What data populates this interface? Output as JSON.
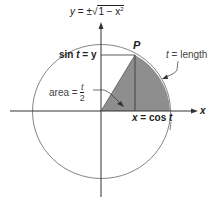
{
  "diagram": {
    "title_equation": {
      "lhs": "y",
      "eq": " = ±",
      "radical": "√",
      "under": "1 − x",
      "exp": "2"
    },
    "labels": {
      "point": "P",
      "sin_lhs": "sin ",
      "sin_t": "t",
      "sin_rhs": " = y",
      "length_t": "t",
      "length_rhs": " = length",
      "area_lhs": "area = ",
      "area_num": "t",
      "area_den": "2",
      "cos_lhs": "x",
      "cos_mid": " = cos ",
      "cos_t": "t",
      "x_axis": "x"
    },
    "colors": {
      "sector": "#8e8e8e",
      "line": "#333333",
      "circle": "#666666"
    },
    "geometry": {
      "center": [
        101,
        111
      ],
      "rx": 69,
      "ry": 67,
      "point_P": [
        135,
        55
      ]
    }
  }
}
